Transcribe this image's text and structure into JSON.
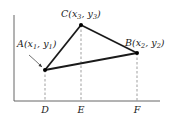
{
  "diagram": {
    "type": "coordinate-triangle",
    "colors": {
      "line": "#1a1a1a",
      "axis": "#555555",
      "dashed": "#777777",
      "background": "#ffffff"
    },
    "points": {
      "A": {
        "name": "A",
        "x_var": "x",
        "x_sub": "1",
        "y_var": "y",
        "y_sub": "1",
        "px": 45,
        "py": 70
      },
      "B": {
        "name": "B",
        "x_var": "x",
        "x_sub": "2",
        "y_var": "y",
        "y_sub": "2",
        "px": 137,
        "py": 53
      },
      "C": {
        "name": "C",
        "x_var": "x",
        "x_sub": "3",
        "y_var": "y",
        "y_sub": "3",
        "px": 81,
        "py": 25
      }
    },
    "axis_feet": [
      {
        "label": "D",
        "px": 45
      },
      {
        "label": "E",
        "px": 81
      },
      {
        "label": "F",
        "px": 137
      }
    ]
  }
}
